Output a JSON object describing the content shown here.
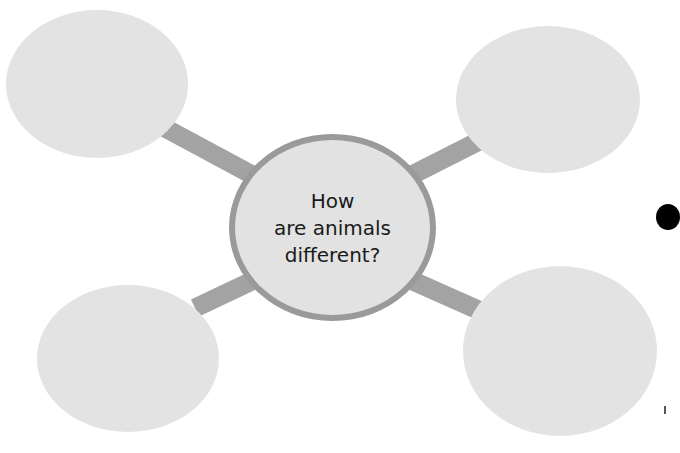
{
  "diagram": {
    "type": "bubble-map",
    "central_question": {
      "lines": [
        "How",
        "are animals",
        "different?"
      ]
    },
    "outer_bubbles": [
      {
        "position": "top-left",
        "text": ""
      },
      {
        "position": "top-right",
        "text": ""
      },
      {
        "position": "bottom-left",
        "text": ""
      },
      {
        "position": "bottom-right",
        "text": ""
      }
    ]
  },
  "colors": {
    "bubble_fill": "#e3e3e3",
    "center_fill": "#e2e2e2",
    "center_ring": "#9a9a9a",
    "connector": "#a3a3a3",
    "text": "#1a1a1a",
    "edge_dot": "#000000"
  }
}
